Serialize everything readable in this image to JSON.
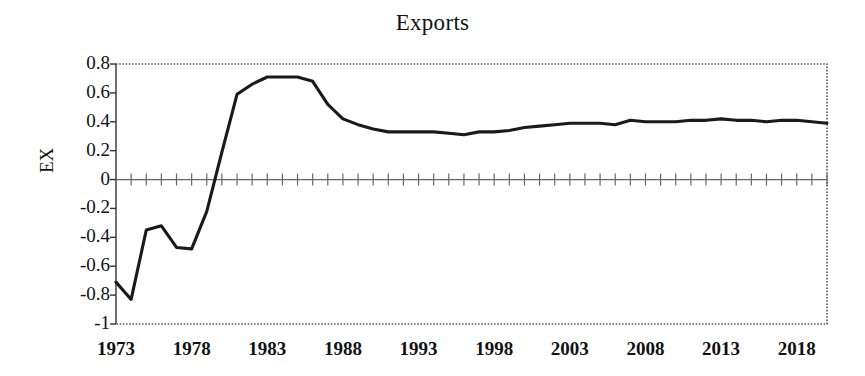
{
  "chart_data": {
    "type": "line",
    "title": "Exports",
    "xlabel": "",
    "ylabel": "EX",
    "ylim": [
      -1,
      0.8
    ],
    "xlim": [
      1973,
      2020
    ],
    "ytick_labels": [
      "0.8",
      "0.6",
      "0.4",
      "0.2",
      "0",
      "-0.2",
      "-0.4",
      "-0.6",
      "-0.8",
      "-1"
    ],
    "ytick_values": [
      0.8,
      0.6,
      0.4,
      0.2,
      0,
      -0.2,
      -0.4,
      -0.6,
      -0.8,
      -1
    ],
    "xtick_labels": [
      "1973",
      "1978",
      "1983",
      "1988",
      "1993",
      "1998",
      "2003",
      "2008",
      "2013",
      "2018"
    ],
    "xtick_values": [
      1973,
      1978,
      1983,
      1988,
      1993,
      1998,
      2003,
      2008,
      2013,
      2018
    ],
    "grid": false,
    "legend": false,
    "line_color": "#1a1a1a",
    "border_style": "dotted",
    "axis_color": "#555555",
    "x": [
      1973,
      1974,
      1975,
      1976,
      1977,
      1978,
      1979,
      1980,
      1981,
      1982,
      1983,
      1984,
      1985,
      1986,
      1987,
      1988,
      1989,
      1990,
      1991,
      1992,
      1993,
      1994,
      1995,
      1996,
      1997,
      1998,
      1999,
      2000,
      2001,
      2002,
      2003,
      2004,
      2005,
      2006,
      2007,
      2008,
      2009,
      2010,
      2011,
      2012,
      2013,
      2014,
      2015,
      2016,
      2017,
      2018,
      2019,
      2020
    ],
    "values": [
      -0.71,
      -0.83,
      -0.35,
      -0.32,
      -0.47,
      -0.48,
      -0.22,
      0.19,
      0.59,
      0.66,
      0.71,
      0.71,
      0.71,
      0.68,
      0.52,
      0.42,
      0.38,
      0.35,
      0.33,
      0.33,
      0.33,
      0.33,
      0.32,
      0.31,
      0.33,
      0.33,
      0.34,
      0.36,
      0.37,
      0.38,
      0.39,
      0.39,
      0.39,
      0.38,
      0.41,
      0.4,
      0.4,
      0.4,
      0.41,
      0.41,
      0.42,
      0.41,
      0.41,
      0.4,
      0.41,
      0.41,
      0.4,
      0.39
    ],
    "series": [
      {
        "name": "EX",
        "values": [
          -0.71,
          -0.83,
          -0.35,
          -0.32,
          -0.47,
          -0.48,
          -0.22,
          0.19,
          0.59,
          0.66,
          0.71,
          0.71,
          0.71,
          0.68,
          0.52,
          0.42,
          0.38,
          0.35,
          0.33,
          0.33,
          0.33,
          0.33,
          0.32,
          0.31,
          0.33,
          0.33,
          0.34,
          0.36,
          0.37,
          0.38,
          0.39,
          0.39,
          0.39,
          0.38,
          0.41,
          0.4,
          0.4,
          0.4,
          0.41,
          0.41,
          0.42,
          0.41,
          0.41,
          0.4,
          0.41,
          0.41,
          0.4,
          0.39
        ]
      }
    ]
  }
}
